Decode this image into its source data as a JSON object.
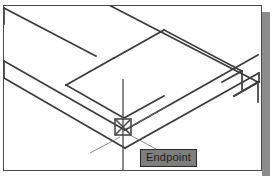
{
  "app": {
    "name": "cad-drawing-area",
    "background_color": "#ffffff",
    "frame_color": "#4a4a4a",
    "shadow_color": "#8c8c8c"
  },
  "drawing": {
    "title": "isometric-channel-solid",
    "line_color": "#3c3c3c",
    "line_width": "1.6",
    "description": "Isometric wireframe view of a rectangular channel / L-shaped extruded solid"
  },
  "crosshair": {
    "name": "crosshair-cursor",
    "color": "#4a4a4a",
    "center_x": "121",
    "center_y": "125",
    "vertical_top": "78",
    "vertical_bottom": "172"
  },
  "snap_marker": {
    "name": "endpoint-snap-marker",
    "shape": "square-with-cross",
    "color": "#4a4a4a",
    "x": "113",
    "y": "117",
    "size": "16"
  },
  "tooltip": {
    "label": "Endpoint",
    "background": "#7e7e7e",
    "border": "#2b2b2b",
    "text_color": "#1c1c1c"
  }
}
